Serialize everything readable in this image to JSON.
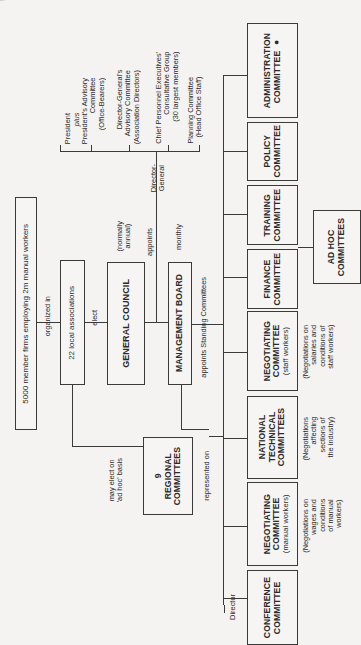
{
  "chart_title": "",
  "members": {
    "label": "5000 member firms employing 2m  manual workers",
    "edge_label": "organized in"
  },
  "local_associations": {
    "label": "22  local associations",
    "edge_label": "elect",
    "regional_edge_label": "may elect on\n'ad hoc' basis"
  },
  "regional": {
    "label": "9\nREGIONAL\nCOMMITTEES",
    "edge_label": "represented on"
  },
  "general_council": {
    "label": "GENERAL COUNCIL",
    "note": "(normally\nannual)",
    "edge_label": "appoints"
  },
  "management_board": {
    "label": "MANAGEMENT BOARD",
    "note": "monthly",
    "edge_label": "appoints  Standing Committees"
  },
  "director_general": {
    "label": "Director-\nGeneral",
    "supports": [
      {
        "label": "President",
        "sub": "plus"
      },
      {
        "label": "President's Advisory\nCommittee\n(Office-Bearers)"
      },
      {
        "label": "Director-General's\nAdvisory Committee\n(Association Directors)"
      },
      {
        "label": "Chief Personnel Executives'\nConsultative Group\n(30 largest members)"
      },
      {
        "label": "Planning Committee\n(Head Office Staff)"
      }
    ]
  },
  "director": {
    "label": "Director"
  },
  "committees": [
    {
      "name": "ADMINISTRATION\nCOMMITTEE ●",
      "sub": "",
      "note": ""
    },
    {
      "name": "POLICY\nCOMMITTEE",
      "sub": "",
      "note": ""
    },
    {
      "name": "TRAINING\nCOMMITTEE",
      "sub": "",
      "note": ""
    },
    {
      "name": "FINANCE\nCOMMITTEE",
      "sub": "",
      "note": ""
    },
    {
      "name": "NEGOTIATING\nCOMMITTEE",
      "sub": "(staff workers)",
      "note": "(Negotiations on\nsalaries and\nconditions of\nstaff workers)"
    },
    {
      "name": "NATIONAL\nTECHNICAL\nCOMMITTEES",
      "sub": "",
      "note": "(Negotiations\naffecting\nsections of\nthe industry)"
    },
    {
      "name": "NEGOTIATING\nCOMMITTEE",
      "sub": "(manual workers)",
      "note": "(Negotiations on\nwages and\nconditions\nof manual\nworkers)"
    },
    {
      "name": "CONFERENCE\nCOMMITTEE",
      "sub": "",
      "note": ""
    }
  ],
  "ad_hoc": {
    "label": "AD HOC\nCOMMITTEES"
  },
  "colors": {
    "ink": "#2a2a2a",
    "paper": "#f4f3f1"
  }
}
